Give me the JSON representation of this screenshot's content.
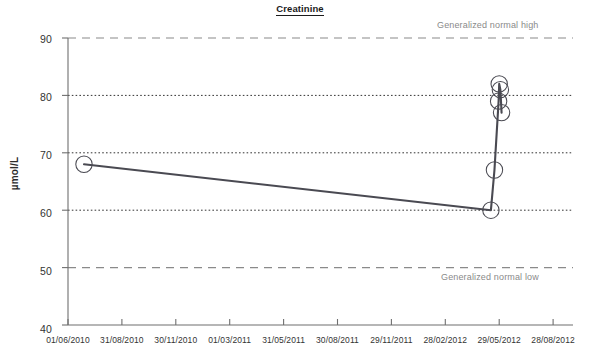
{
  "chart_data": {
    "type": "line",
    "title": "Creatinine",
    "xlabel": "",
    "ylabel": "µmol/L",
    "ylim": [
      40,
      90
    ],
    "yticks": [
      40,
      50,
      60,
      70,
      80,
      90
    ],
    "ytick_labels": [
      "40",
      "50",
      "60",
      "70",
      "80",
      "90"
    ],
    "xtick_labels": [
      "01/06/2010",
      "31/08/2010",
      "30/11/2010",
      "01/03/2011",
      "31/05/2011",
      "30/08/2011",
      "29/11/2011",
      "28/02/2012",
      "29/05/2012",
      "28/08/2012"
    ],
    "grid": true,
    "legend": "none",
    "series": [
      {
        "name": "Creatinine",
        "x": [
          "28/06/2010",
          "15/05/2012",
          "21/05/2012",
          "28/05/2012",
          "29/05/2012",
          "31/05/2012",
          "02/06/2012"
        ],
        "values": [
          68,
          60,
          67,
          79,
          82,
          81,
          77
        ],
        "marker": "open-circle",
        "color": "#4a4a52"
      }
    ],
    "reference_lines": [
      {
        "name": "Generalized normal high",
        "value": 90,
        "label": "Generalized normal high",
        "style": "long-dash",
        "color": "#8a8a8a"
      },
      {
        "name": "Generalized normal low",
        "value": 50,
        "label": "Generalized normal low",
        "style": "long-dash",
        "color": "#8a8a8a"
      },
      {
        "name": "gridline-80",
        "value": 80,
        "label": "",
        "style": "dotted",
        "color": "#333333"
      },
      {
        "name": "gridline-70",
        "value": 70,
        "label": "",
        "style": "dotted",
        "color": "#333333"
      },
      {
        "name": "gridline-60",
        "value": 60,
        "label": "",
        "style": "dotted",
        "color": "#333333"
      }
    ]
  },
  "colors": {
    "series_line": "#4a4a52",
    "axis": "#6f6f6f",
    "grid_dotted": "#333333",
    "grid_dashed": "#8a8a8a",
    "text": "#333333",
    "muted_text": "#8a8a8a",
    "background": "#ffffff"
  }
}
